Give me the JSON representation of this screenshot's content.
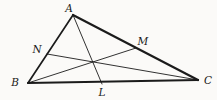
{
  "figure": {
    "background": "#fbfaf8",
    "stroke_color": "#1b1b1b",
    "width": 217,
    "height": 100,
    "points": {
      "A": {
        "x": 73,
        "y": 15
      },
      "B": {
        "x": 28,
        "y": 83
      },
      "C": {
        "x": 198,
        "y": 80
      },
      "N": {
        "x": 47,
        "y": 54
      },
      "M": {
        "x": 136,
        "y": 48
      },
      "L": {
        "x": 102,
        "y": 84
      }
    },
    "edges": [
      {
        "from": "A",
        "to": "B",
        "width": 1.7
      },
      {
        "from": "A",
        "to": "C",
        "width": 2.2
      },
      {
        "from": "B",
        "to": "C",
        "width": 2.2
      }
    ],
    "cevians": [
      {
        "from": "A",
        "to": "L",
        "width": 0.9
      },
      {
        "from": "B",
        "to": "M",
        "width": 0.9
      },
      {
        "from": "C",
        "to": "N",
        "width": 0.9
      }
    ],
    "labels": [
      {
        "text": "A",
        "x": 69,
        "y": 12
      },
      {
        "text": "B",
        "x": 15,
        "y": 86
      },
      {
        "text": "C",
        "x": 208,
        "y": 84
      },
      {
        "text": "N",
        "x": 37,
        "y": 53
      },
      {
        "text": "M",
        "x": 143,
        "y": 45
      },
      {
        "text": "L",
        "x": 102,
        "y": 96
      }
    ]
  }
}
